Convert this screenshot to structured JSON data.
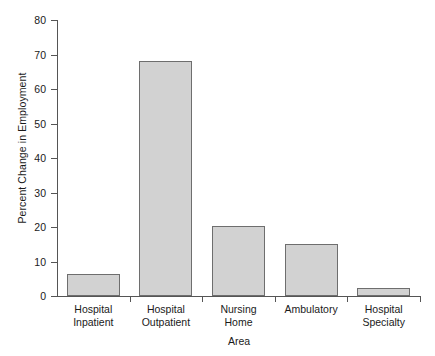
{
  "chart_data": {
    "type": "bar",
    "title": "",
    "xlabel": "Area",
    "ylabel": "Percent Change in Employment",
    "categories": [
      "Hospital Inpatient",
      "Hospital Outpatient",
      "Nursing Home",
      "Ambulatory",
      "Hospital Specialty"
    ],
    "category_lines": [
      [
        "Hospital",
        "Inpatient"
      ],
      [
        "Hospital",
        "Outpatient"
      ],
      [
        "Nursing",
        "Home"
      ],
      [
        "Ambulatory",
        ""
      ],
      [
        "Hospital",
        "Specialty"
      ]
    ],
    "values": [
      6.3,
      68.0,
      20.3,
      15.2,
      2.3
    ],
    "ylim": [
      0,
      80
    ],
    "yticks": [
      0,
      10,
      20,
      30,
      40,
      50,
      60,
      70,
      80
    ],
    "ytick_labels": [
      "0",
      "10",
      "20",
      "30",
      "40",
      "50",
      "60",
      "70",
      "80"
    ],
    "grid": false,
    "legend": false,
    "bar_fill_color": "#d2d2d2",
    "bar_border_color": "#6e6e6e",
    "axis_color": "#555555",
    "background_color": "#ffffff"
  }
}
